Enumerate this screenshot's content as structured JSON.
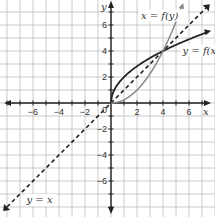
{
  "chart_data": {
    "type": "line",
    "title": "",
    "xlabel": "x",
    "ylabel": "y",
    "xlim": [
      -8.5,
      7.8
    ],
    "ylim": [
      -8.6,
      8.0
    ],
    "grid": true,
    "x_ticks": [
      -6,
      -4,
      -2,
      0,
      2,
      4,
      6
    ],
    "y_ticks": [
      -6,
      -4,
      -2,
      2,
      4,
      6
    ],
    "x_tick_labels": [
      "−6",
      "−4",
      "−2",
      "0",
      "2",
      "4",
      "6"
    ],
    "y_tick_labels": [
      "−6",
      "−4",
      "−2",
      "2",
      "4",
      "6"
    ],
    "series": [
      {
        "name": "y = f(x)",
        "style": "solid dark",
        "description": "y = 2√x",
        "points": [
          [
            0,
            0
          ],
          [
            0.25,
            1
          ],
          [
            1,
            2
          ],
          [
            2.25,
            3
          ],
          [
            4,
            4
          ],
          [
            6.25,
            5
          ],
          [
            7.5,
            5.48
          ]
        ]
      },
      {
        "name": "x = f(y)",
        "style": "solid gray",
        "description": "y = x²/4 (x ≥ 0)",
        "points": [
          [
            0,
            0
          ],
          [
            1,
            0.25
          ],
          [
            2,
            1
          ],
          [
            3,
            2.25
          ],
          [
            4,
            4
          ],
          [
            5,
            6.25
          ],
          [
            5.5,
            7.56
          ]
        ]
      },
      {
        "name": "y = x",
        "style": "dashed",
        "points": [
          [
            -8,
            -8
          ],
          [
            7.5,
            7.5
          ]
        ]
      }
    ],
    "annotations": [
      {
        "text": "x = f(y)",
        "x": 2.3,
        "y": 6.5
      },
      {
        "text": "y = f(x)",
        "x": 5.5,
        "y": 3.8
      },
      {
        "text": "y = x",
        "x": -6.5,
        "y": -7.7
      }
    ]
  }
}
